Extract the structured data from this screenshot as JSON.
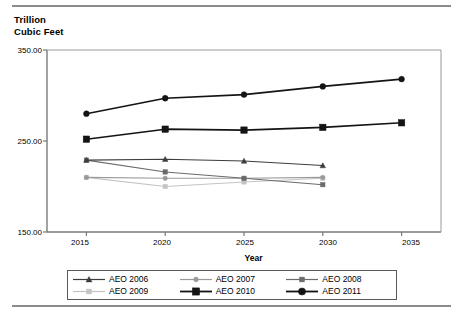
{
  "figure": {
    "y_axis_title": "Trillion\nCubic Feet",
    "x_axis_title": "Year"
  },
  "chart_data": {
    "type": "line",
    "title": "",
    "subtitle": "",
    "xlabel": "Year",
    "ylabel": "Trillion Cubic Feet",
    "x": [
      2015,
      2020,
      2025,
      2030,
      2035
    ],
    "xticklabels": [
      "2015",
      "2020",
      "2025",
      "2030",
      "2035"
    ],
    "yticks": [
      150,
      250,
      350
    ],
    "yticklabels": [
      "150.00",
      "250.00",
      "350.00"
    ],
    "ylim": [
      150,
      350
    ],
    "xlim": [
      2012.5,
      2037.5
    ],
    "grid": false,
    "legend_position": "below-axes",
    "series": [
      {
        "name": "AEO 2006",
        "color": "#3d3d3d",
        "marker": "triangle",
        "x": [
          2015,
          2020,
          2025,
          2030
        ],
        "values": [
          229,
          230,
          228,
          223
        ]
      },
      {
        "name": "AEO 2007",
        "color": "#9a9a9a",
        "marker": "circle",
        "x": [
          2015,
          2020,
          2025,
          2030
        ],
        "values": [
          210,
          209,
          209,
          210
        ]
      },
      {
        "name": "AEO 2008",
        "color": "#6b6b6b",
        "marker": "square",
        "x": [
          2015,
          2020,
          2025,
          2030
        ],
        "values": [
          229,
          216,
          209,
          202
        ]
      },
      {
        "name": "AEO 2009",
        "color": "#c4c4c4",
        "marker": "square",
        "x": [
          2015,
          2020,
          2025,
          2030
        ],
        "values": [
          210,
          200,
          205,
          209
        ]
      },
      {
        "name": "AEO 2010",
        "color": "#141414",
        "marker": "square",
        "x": [
          2015,
          2020,
          2025,
          2030,
          2035
        ],
        "values": [
          252,
          263,
          262,
          265,
          270
        ]
      },
      {
        "name": "AEO 2011",
        "color": "#141414",
        "marker": "circle",
        "x": [
          2015,
          2020,
          2025,
          2030,
          2035
        ],
        "values": [
          280,
          297,
          301,
          310,
          318
        ]
      }
    ]
  },
  "legend": {
    "entries": [
      {
        "label": "AEO 2006",
        "color": "#3d3d3d",
        "marker": "triangle"
      },
      {
        "label": "AEO 2007",
        "color": "#9a9a9a",
        "marker": "circle"
      },
      {
        "label": "AEO 2008",
        "color": "#6b6b6b",
        "marker": "square"
      },
      {
        "label": "AEO 2009",
        "color": "#c4c4c4",
        "marker": "square"
      },
      {
        "label": "AEO 2010",
        "color": "#141414",
        "marker": "square-large"
      },
      {
        "label": "AEO 2011",
        "color": "#141414",
        "marker": "circle-large"
      }
    ]
  },
  "axis_labels": {
    "y": [
      "350.00",
      "250.00",
      "150.00"
    ],
    "x": [
      "2015",
      "2020",
      "2025",
      "2030",
      "2035"
    ]
  }
}
